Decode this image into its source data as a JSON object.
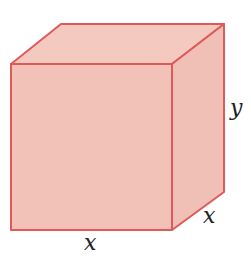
{
  "diagram": {
    "type": "cuboid",
    "colors": {
      "fill": "#f2c1b8",
      "stroke": "#e05a5a"
    },
    "labels": {
      "height": "y",
      "depth": "x",
      "width": "x"
    }
  }
}
